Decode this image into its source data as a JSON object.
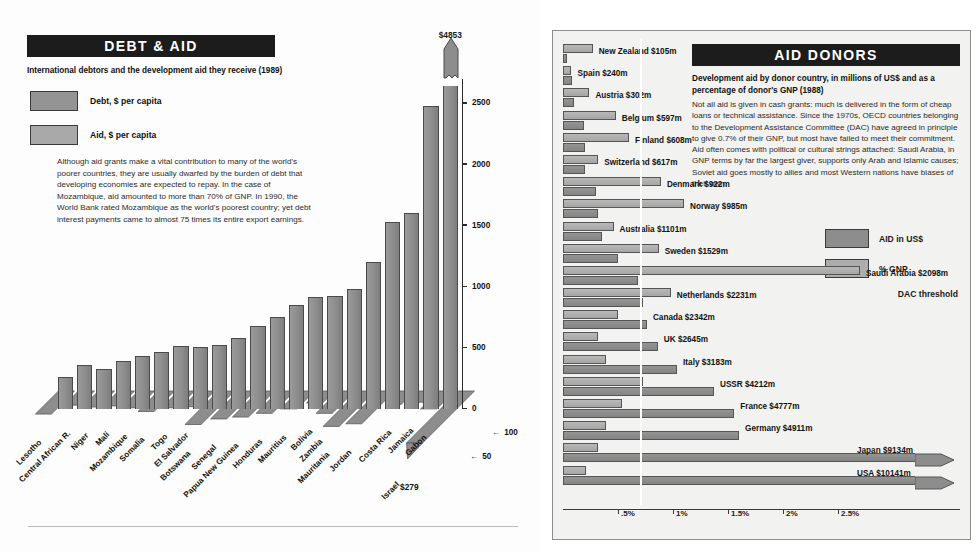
{
  "left": {
    "title": "DEBT & AID",
    "subtitle": "International debtors and the development aid they receive (1989)",
    "legend": [
      {
        "label": "Debt, $ per capita",
        "color": "#949494"
      },
      {
        "label": "Aid, $ per capita",
        "color": "#a9a9a9"
      }
    ],
    "body": "Although aid grants make a vital contribution to many of the  world's poorer countries, they are usually dwarfed by the burden of debt that developing economies are expected to repay. In the case of Mozambique, aid amounted to more than 70% of GNP.  In 1990, the World Bank rated Mozambique as the world's poorest country; yet debt interest payments came to almost 75 times its entire export earnings.",
    "peak_label": "$4853",
    "israel_aid_label": "$279",
    "baseline_color": "#b9b9b9"
  },
  "right": {
    "title": "AID DONORS",
    "subtitle": "Development aid by donor country, in millions of US$ and as a percentage of donor's GNP (1988)",
    "body": "Not all aid is given in cash grants:  much is delivered in the form of cheap loans or technical assistance. Since the 1970s, OECD countries belonging to the Development Assistance Committee (DAC) have agreed in principle to give 0.7% of their GNP, but most have failed to meet their commitment. Aid often comes with political or cultural strings attached:  Saudi Arabia, in GNP terms by far the largest giver, supports only Arab and Islamic causes; Soviet aid goes mostly to allies and most Western nations have biases of their own.",
    "legend": [
      {
        "label": "AID in US$",
        "color": "#8d8d8d"
      },
      {
        "label": "% GNP",
        "color": "#adadad"
      }
    ],
    "dac_threshold_label": "DAC threshold"
  },
  "chart_data": [
    {
      "type": "bar",
      "id": "debt-and-aid",
      "title": "DEBT & AID",
      "subtitle": "International debtors and the development aid they receive (1989)",
      "xlabel": "",
      "ylabel": "Debt, $ per capita",
      "ylim": [
        0,
        2700
      ],
      "yticks": [
        0,
        500,
        1000,
        1500,
        2000,
        2500
      ],
      "ytick_labels": [
        "0",
        "500",
        "1000",
        "1500",
        "2000",
        "2500"
      ],
      "aid_axis_ticks": [
        50,
        100
      ],
      "aid_axis_tick_labels": [
        "50",
        "100"
      ],
      "grid": false,
      "legend": [
        "Debt, $ per capita",
        "Aid, $ per capita"
      ],
      "categories": [
        "Lesotho",
        "Central African R.",
        "Niger",
        "Mali",
        "Mozambique",
        "Somalia",
        "Togo",
        "El Salvador",
        "Botswana",
        "Senegal",
        "Papua New Guinea",
        "Honduras",
        "Mauritius",
        "Bolivia",
        "Zambia",
        "Mauritania",
        "Jordan",
        "Costa Rica",
        "Jamaica",
        "Gabon",
        "Israel"
      ],
      "series": [
        {
          "name": "Debt, $ per capita",
          "values": [
            265,
            360,
            330,
            390,
            430,
            470,
            515,
            510,
            520,
            585,
            680,
            755,
            850,
            920,
            925,
            985,
            1200,
            1530,
            1600,
            2480,
            4853
          ]
        },
        {
          "name": "Aid, $ per capita",
          "values": [
            62,
            38,
            43,
            40,
            45,
            55,
            45,
            42,
            90,
            75,
            70,
            60,
            48,
            32,
            60,
            95,
            88,
            36,
            30,
            48,
            279
          ]
        }
      ],
      "annotations": [
        {
          "text": "$4853",
          "target": "Israel",
          "note": "broken bar, exceeds axis"
        },
        {
          "text": "$279",
          "target": "Israel aid"
        }
      ]
    },
    {
      "type": "bar",
      "id": "aid-donors",
      "orientation": "horizontal",
      "title": "AID DONORS",
      "subtitle": "Development aid by donor country, in millions of US$ and as a percentage of donor's GNP (1988)",
      "xlabel": "",
      "grid": false,
      "legend": [
        "AID in US$",
        "% GNP"
      ],
      "pct_axis_ticks": [
        0.5,
        1.0,
        1.5,
        2.0,
        2.5
      ],
      "pct_axis_tick_labels": [
        ".5%",
        "1%",
        "1.5%",
        "2%",
        "2.5%"
      ],
      "dac_threshold_pct": 0.7,
      "categories": [
        "New Zealand",
        "Spain",
        "Austria",
        "Belgium",
        "Finland",
        "Switzerland",
        "Denmark",
        "Norway",
        "Australia",
        "Sweden",
        "Saudi Arabia",
        "Netherlands",
        "Canada",
        "UK",
        "Italy",
        "USSR",
        "France",
        "Germany",
        "Japan",
        "USA"
      ],
      "aid_usd_millions": [
        105,
        240,
        302,
        597,
        608,
        617,
        922,
        985,
        1101,
        1529,
        2098,
        2231,
        2342,
        2645,
        3183,
        4212,
        4777,
        4911,
        9134,
        10141
      ],
      "aid_labels": [
        "New Zealand $105m",
        "Spain $240m",
        "Austria $302m",
        "Belgium $597m",
        "Finland $608m",
        "Switzerland $617m",
        "Denmark $922m",
        "Norway $985m",
        "Australia $1101m",
        "Sweden $1529m",
        "Saudi Arabia $2098m",
        "Netherlands $2231m",
        "Canada $2342m",
        "UK $2645m",
        "Italy $3183m",
        "USSR $4212m",
        "France $4777m",
        "Germany $4911m",
        "Japan $9134m",
        "USA $10141m"
      ],
      "gnp_pct": [
        0.27,
        0.07,
        0.24,
        0.48,
        0.6,
        0.32,
        0.89,
        1.1,
        0.46,
        0.87,
        2.7,
        0.98,
        0.5,
        0.32,
        0.39,
        0.73,
        0.54,
        0.39,
        0.32,
        0.21
      ],
      "capped_series": [
        "Japan",
        "USA"
      ],
      "capped_note": "arrow indicates bar extends beyond plot area"
    }
  ]
}
